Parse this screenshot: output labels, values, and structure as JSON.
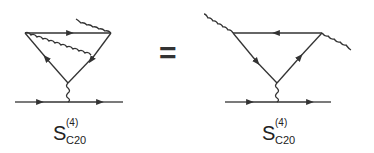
{
  "equation": {
    "operator": "=",
    "left": {
      "symbol": "S",
      "superscript": "(4)",
      "subscript": "C20"
    },
    "right": {
      "symbol": "S",
      "superscript": "(4)",
      "subscript": "C20"
    }
  },
  "colors": {
    "line": "#333333",
    "background": "#ffffff"
  }
}
